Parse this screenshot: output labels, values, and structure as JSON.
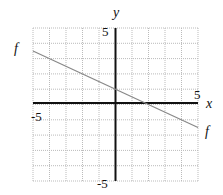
{
  "chart_data": {
    "type": "line",
    "title": "",
    "xlabel": "x",
    "ylabel": "y",
    "xlim": [
      -5,
      5
    ],
    "ylim": [
      -5,
      5
    ],
    "grid": true,
    "tick_labels": {
      "x_min": "-5",
      "x_max": "5",
      "y_min": "-5",
      "y_max": "5"
    },
    "series": [
      {
        "name": "f",
        "x": [
          -5,
          0,
          2,
          5
        ],
        "y": [
          3.5,
          1,
          0,
          -1.5
        ]
      }
    ],
    "annotations": [
      "f",
      "f"
    ]
  },
  "labels": {
    "x_axis": "x",
    "y_axis": "y",
    "x_min": "-5",
    "x_max": "5",
    "y_min": "-5",
    "y_max": "5",
    "f_left": "f",
    "f_right": "f"
  },
  "colors": {
    "line": "#888888",
    "axis": "#111111",
    "grid": "#bbbbbb"
  }
}
